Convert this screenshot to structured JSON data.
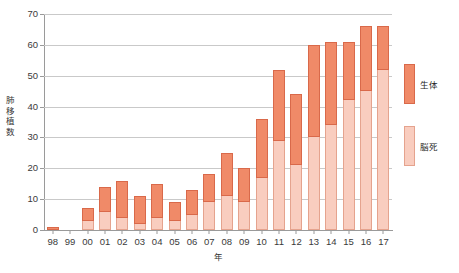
{
  "chart_data": {
    "type": "bar",
    "title": "",
    "xlabel": "年",
    "ylabel": "肺移植数",
    "ylim": [
      0,
      70
    ],
    "yticks": [
      0,
      10,
      20,
      30,
      40,
      50,
      60,
      70
    ],
    "grid": true,
    "stacked": true,
    "legend_position": "right",
    "categories": [
      "98",
      "99",
      "00",
      "01",
      "02",
      "03",
      "04",
      "05",
      "06",
      "07",
      "08",
      "09",
      "10",
      "11",
      "12",
      "13",
      "14",
      "15",
      "16",
      "17"
    ],
    "series": [
      {
        "name": "脳死",
        "color": "#f9cdbf",
        "values": [
          0,
          0,
          3,
          6,
          4,
          2,
          4,
          3,
          5,
          9,
          11,
          9,
          17,
          29,
          21,
          30,
          34,
          42,
          45,
          52
        ]
      },
      {
        "name": "生体",
        "color": "#f08a68",
        "values": [
          1,
          0,
          4,
          8,
          12,
          9,
          11,
          6,
          8,
          9,
          14,
          11,
          19,
          23,
          23,
          30,
          27,
          19,
          21,
          14
        ]
      }
    ],
    "totals": [
      1,
      0,
      7,
      14,
      16,
      11,
      15,
      9,
      13,
      18,
      25,
      20,
      36,
      52,
      44,
      60,
      61,
      61,
      66,
      66
    ],
    "annotations": []
  },
  "legend": {
    "items": [
      {
        "label": "生体",
        "swatch": "living-donor-swatch"
      },
      {
        "label": "脳死",
        "swatch": "brain-death-swatch"
      }
    ]
  },
  "axes": {
    "y_title_chars": [
      "肺",
      "移",
      "植",
      "数"
    ],
    "x_title": "年"
  },
  "caption": ""
}
